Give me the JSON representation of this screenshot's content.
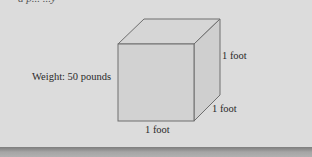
{
  "header": {
    "cut_text": "a p... ...y"
  },
  "figure": {
    "weight_label": "Weight: 50 pounds",
    "height_label": "1 foot",
    "depth_label": "1 foot",
    "width_label": "1 foot",
    "colors": {
      "background": "#dcdcdc",
      "face": "#d2d2d2",
      "edge": "#6e6e6e",
      "bottom_bar": "#8a8a8a"
    }
  }
}
